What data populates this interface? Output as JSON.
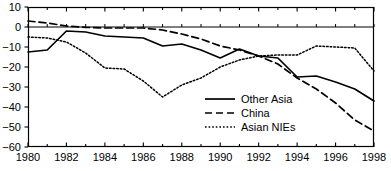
{
  "chart_data": {
    "type": "line",
    "title": "",
    "subtitle": "",
    "xlabel": "",
    "ylabel": "",
    "grid": false,
    "legend_position": "inside-lower-center-right",
    "x": [
      1980,
      1981,
      1982,
      1983,
      1984,
      1985,
      1986,
      1987,
      1988,
      1989,
      1990,
      1991,
      1992,
      1993,
      1994,
      1995,
      1996,
      1997,
      1998
    ],
    "xlim": [
      1980,
      1998
    ],
    "ylim": [
      -60,
      10
    ],
    "xtick_labels": [
      "1980",
      "1982",
      "1984",
      "1986",
      "1988",
      "1990",
      "1992",
      "1994",
      "1996",
      "1998"
    ],
    "xticks": [
      1980,
      1982,
      1984,
      1986,
      1988,
      1990,
      1992,
      1994,
      1996,
      1998
    ],
    "yticks": [
      10,
      0,
      -10,
      -20,
      -30,
      -40,
      -50,
      -60
    ],
    "ytick_labels": [
      "10",
      "0",
      "−10",
      "−20",
      "−30",
      "−40",
      "−50",
      "−60"
    ],
    "zero_line": 0,
    "series": [
      {
        "name": "Other Asia",
        "style": "solid",
        "color": "#000000",
        "values": [
          -12.5,
          -11.5,
          -2.0,
          -2.5,
          -4.5,
          -5.0,
          -5.5,
          -9.5,
          -8.5,
          -11.5,
          -15.5,
          -11.0,
          -14.5,
          -15.5,
          -25.0,
          -24.5,
          -27.5,
          -31.0,
          -37.0
        ]
      },
      {
        "name": "China",
        "style": "dashed",
        "color": "#000000",
        "values": [
          3.0,
          2.0,
          0.5,
          -0.2,
          -0.5,
          -0.5,
          -0.5,
          -1.5,
          -3.5,
          -6.0,
          -9.5,
          -11.5,
          -14.5,
          -18.5,
          -25.5,
          -31.0,
          -38.0,
          -46.5,
          -52.0
        ]
      },
      {
        "name": "Asian NIEs",
        "style": "dotted",
        "color": "#000000",
        "values": [
          -5.0,
          -5.5,
          -7.5,
          -13.0,
          -20.5,
          -21.0,
          -27.0,
          -35.0,
          -29.0,
          -25.5,
          -20.0,
          -16.5,
          -14.5,
          -14.0,
          -14.0,
          -9.5,
          -10.0,
          -10.5,
          -22.0
        ]
      }
    ]
  },
  "legend": {
    "items": [
      {
        "label": "Other Asia",
        "style": "solid"
      },
      {
        "label": "China",
        "style": "dashed"
      },
      {
        "label": "Asian NIEs",
        "style": "dotted"
      }
    ]
  }
}
